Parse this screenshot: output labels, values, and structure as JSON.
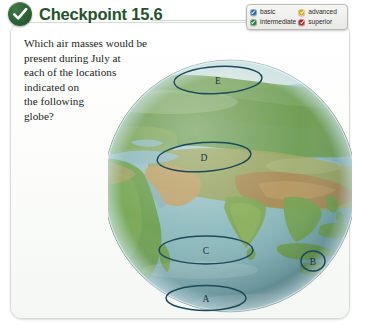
{
  "header": {
    "title": "Checkpoint 15.6",
    "icon": "check-circle-icon"
  },
  "legend": {
    "items": [
      {
        "label": "basic",
        "color": "#2e68a8",
        "icon": "check-circle-icon"
      },
      {
        "label": "advanced",
        "color": "#d8a818",
        "icon": "check-circle-icon"
      },
      {
        "label": "intermediate",
        "color": "#2f7d4a",
        "icon": "check-circle-icon"
      },
      {
        "label": "superior",
        "color": "#a82a22",
        "icon": "check-circle-icon"
      }
    ]
  },
  "question": {
    "lines": [
      "Which air masses would be",
      "present during July at",
      "each of the locations",
      "indicated on",
      "the following",
      "globe?"
    ]
  },
  "globe": {
    "description": "Eastern Hemisphere globe showing Africa, Europe, Asia and the Indian Ocean",
    "annotation_color": "#1d4a58",
    "annotations": [
      {
        "label": "E",
        "region": "arctic-northern-russia"
      },
      {
        "label": "D",
        "region": "south-asia-india"
      },
      {
        "label": "C",
        "region": "central-indian-ocean"
      },
      {
        "label": "B",
        "region": "indonesia-east-edge"
      },
      {
        "label": "A",
        "region": "southern-indian-ocean"
      }
    ]
  }
}
